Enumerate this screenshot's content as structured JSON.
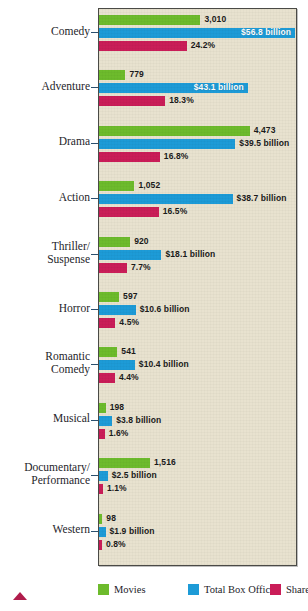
{
  "chart_data": {
    "type": "bar",
    "orientation": "horizontal",
    "title": "",
    "subtitle": "",
    "xlabel": "",
    "ylabel": "",
    "grid": false,
    "legend_position": "bottom",
    "categories": [
      "Comedy",
      "Adventure",
      "Drama",
      "Action",
      "Thriller/\nSuspense",
      "Horror",
      "Romantic\nComedy",
      "Musical",
      "Documentary/\nPerformance",
      "Western"
    ],
    "series": [
      {
        "name": "Movies",
        "color": "#6dbb2c",
        "values": [
          3010,
          779,
          4473,
          1052,
          920,
          597,
          541,
          198,
          1516,
          98
        ],
        "labels": [
          "3,010",
          "779",
          "4,473",
          "1,052",
          "920",
          "597",
          "541",
          "198",
          "1,516",
          "98"
        ]
      },
      {
        "name": "Total Box Office",
        "color": "#1d9bd7",
        "values": [
          56.8,
          43.1,
          39.5,
          38.7,
          18.1,
          10.6,
          10.4,
          3.8,
          2.5,
          1.9
        ],
        "unit": "billion USD",
        "labels": [
          "$56.8 billion",
          "$43.1 billion",
          "$39.5 billion",
          "$38.7 billion",
          "$18.1 billion",
          "$10.6 billion",
          "$10.4 billion",
          "$3.8 billion",
          "$2.5 billion",
          "$1.9 billion"
        ]
      },
      {
        "name": "Share",
        "color": "#ca1d58",
        "values": [
          24.2,
          18.3,
          16.8,
          16.5,
          7.7,
          4.5,
          4.4,
          1.6,
          1.1,
          0.8
        ],
        "unit": "percent",
        "labels": [
          "24.2%",
          "18.3%",
          "16.8%",
          "16.5%",
          "7.7%",
          "4.5%",
          "4.4%",
          "1.6%",
          "1.1%",
          "0.8%"
        ]
      }
    ],
    "groups": [
      {
        "category": "Comedy",
        "movies": {
          "label": "3,010",
          "pct": 51.5,
          "inside": false
        },
        "boxoffice": {
          "label": "$56.8 billion",
          "pct": 99.5,
          "inside": true
        },
        "share": {
          "label": "24.2%",
          "pct": 44.5,
          "inside": false
        }
      },
      {
        "category": "Adventure",
        "movies": {
          "label": "779",
          "pct": 13.4,
          "inside": false
        },
        "boxoffice": {
          "label": "$43.1 billion",
          "pct": 75.5,
          "inside": true
        },
        "share": {
          "label": "18.3%",
          "pct": 33.6,
          "inside": false
        }
      },
      {
        "category": "Drama",
        "movies": {
          "label": "4,473",
          "pct": 76.5,
          "inside": false
        },
        "boxoffice": {
          "label": "$39.5 billion",
          "pct": 69.2,
          "inside": false
        },
        "share": {
          "label": "16.8%",
          "pct": 30.9,
          "inside": false
        }
      },
      {
        "category": "Action",
        "movies": {
          "label": "1,052",
          "pct": 18.0,
          "inside": false
        },
        "boxoffice": {
          "label": "$38.7 billion",
          "pct": 67.8,
          "inside": false
        },
        "share": {
          "label": "16.5%",
          "pct": 30.3,
          "inside": false
        }
      },
      {
        "category": "Thriller/\nSuspense",
        "movies": {
          "label": "920",
          "pct": 15.8,
          "inside": false
        },
        "boxoffice": {
          "label": "$18.1 billion",
          "pct": 31.7,
          "inside": false
        },
        "share": {
          "label": "7.7%",
          "pct": 14.2,
          "inside": false
        }
      },
      {
        "category": "Horror",
        "movies": {
          "label": "597",
          "pct": 10.2,
          "inside": false
        },
        "boxoffice": {
          "label": "$10.6 billion",
          "pct": 18.6,
          "inside": false
        },
        "share": {
          "label": "4.5%",
          "pct": 8.3,
          "inside": false
        }
      },
      {
        "category": "Romantic\nComedy",
        "movies": {
          "label": "541",
          "pct": 9.3,
          "inside": false
        },
        "boxoffice": {
          "label": "$10.4 billion",
          "pct": 18.2,
          "inside": false
        },
        "share": {
          "label": "4.4%",
          "pct": 8.1,
          "inside": false
        }
      },
      {
        "category": "Musical",
        "movies": {
          "label": "198",
          "pct": 3.4,
          "inside": false
        },
        "boxoffice": {
          "label": "$3.8 billion",
          "pct": 6.7,
          "inside": false
        },
        "share": {
          "label": "1.6%",
          "pct": 2.9,
          "inside": false
        }
      },
      {
        "category": "Documentary/\nPerformance",
        "movies": {
          "label": "1,516",
          "pct": 25.9,
          "inside": false
        },
        "boxoffice": {
          "label": "$2.5 billion",
          "pct": 4.4,
          "inside": false
        },
        "share": {
          "label": "1.1%",
          "pct": 2.0,
          "inside": false
        }
      },
      {
        "category": "Western",
        "movies": {
          "label": "98",
          "pct": 1.7,
          "inside": false
        },
        "boxoffice": {
          "label": "$1.9 billion",
          "pct": 3.3,
          "inside": false
        },
        "share": {
          "label": "0.8%",
          "pct": 1.5,
          "inside": false
        }
      }
    ],
    "legend": [
      {
        "name": "Movies",
        "color": "#6dbb2c"
      },
      {
        "name": "Total Box Office",
        "color": "#1d9bd7"
      },
      {
        "name": "Share",
        "color": "#ca1d58"
      }
    ]
  },
  "style": {
    "plot_background": "#e8e2cf",
    "frame_color": "#4a4a46",
    "text_color": "#25252a"
  }
}
